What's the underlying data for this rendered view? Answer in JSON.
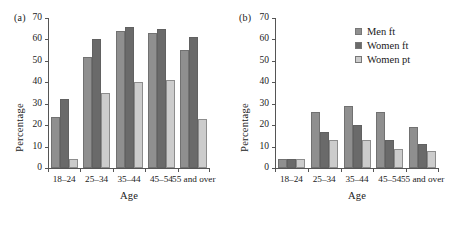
{
  "figure": {
    "panel_a_label": "(a)",
    "panel_b_label": "(b)"
  },
  "legend": {
    "position": "top-right of panel b",
    "entries": [
      {
        "label": "Men ft",
        "color": "#8f8f8f"
      },
      {
        "label": "Women ft",
        "color": "#6a6a6a"
      },
      {
        "label": "Women pt",
        "color": "#cccccc"
      }
    ]
  },
  "chart_data": [
    {
      "type": "bar",
      "panel": "(a)",
      "title": "",
      "xlabel": "Age",
      "ylabel": "Percentage",
      "categories": [
        "18–24",
        "25–34",
        "35–44",
        "45–54",
        "55 and over"
      ],
      "ylim": [
        0,
        70
      ],
      "yticks": [
        0,
        10,
        20,
        30,
        40,
        50,
        60,
        70
      ],
      "ytick_labels": [
        "0",
        "10",
        "20",
        "30",
        "40",
        "50",
        "60",
        "70"
      ],
      "grid": false,
      "series": [
        {
          "name": "Men ft",
          "color": "#8f8f8f",
          "values": [
            24,
            52,
            64,
            63,
            55
          ]
        },
        {
          "name": "Women ft",
          "color": "#6a6a6a",
          "values": [
            32,
            60,
            66,
            65,
            61
          ]
        },
        {
          "name": "Women pt",
          "color": "#cccccc",
          "values": [
            4,
            35,
            40,
            41,
            23
          ]
        }
      ]
    },
    {
      "type": "bar",
      "panel": "(b)",
      "title": "",
      "xlabel": "Age",
      "ylabel": "Percentage",
      "categories": [
        "18–24",
        "25–34",
        "35–44",
        "45–54",
        "55 and over"
      ],
      "ylim": [
        0,
        70
      ],
      "yticks": [
        0,
        10,
        20,
        30,
        40,
        50,
        60,
        70
      ],
      "ytick_labels": [
        "0",
        "10",
        "20",
        "30",
        "40",
        "50",
        "60",
        "70"
      ],
      "grid": false,
      "series": [
        {
          "name": "Men ft",
          "color": "#8f8f8f",
          "values": [
            4,
            26,
            29,
            26,
            19
          ]
        },
        {
          "name": "Women ft",
          "color": "#6a6a6a",
          "values": [
            4,
            17,
            20,
            13,
            11
          ]
        },
        {
          "name": "Women pt",
          "color": "#cccccc",
          "values": [
            4,
            13,
            13,
            9,
            8
          ]
        }
      ]
    }
  ]
}
